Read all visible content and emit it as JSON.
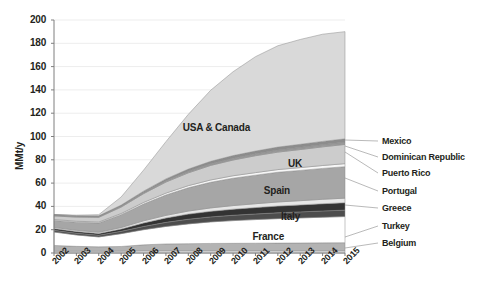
{
  "chart_data": {
    "type": "area",
    "title": "",
    "xlabel": "",
    "ylabel": "MMt/y",
    "ylim": [
      0,
      200
    ],
    "ytick_step": 20,
    "grid": true,
    "legend_position": "right-and-inline",
    "stacked": true,
    "x": [
      "2002",
      "2003",
      "2004",
      "2005",
      "2006",
      "2007",
      "2008",
      "2009",
      "2010",
      "2011",
      "2012",
      "2013",
      "2014",
      "2015"
    ],
    "yticks": [
      "0",
      "20",
      "40",
      "60",
      "80",
      "100",
      "120",
      "140",
      "160",
      "180",
      "200"
    ],
    "series": [
      {
        "name": "Belgium",
        "color": "#f2f2f2",
        "values": [
          1.5,
          1.5,
          1.5,
          1.6,
          1.8,
          1.8,
          1.8,
          1.8,
          1.8,
          1.8,
          1.8,
          1.8,
          1.8,
          1.8
        ]
      },
      {
        "name": "Turkey",
        "color": "#b3b3b3",
        "values": [
          5.0,
          4.2,
          3.8,
          4.0,
          5.2,
          6.0,
          6.2,
          6.4,
          6.5,
          6.6,
          6.7,
          6.8,
          6.9,
          7.0
        ]
      },
      {
        "name": "France",
        "color": "#ffffff",
        "values": [
          11.5,
          9.8,
          8.5,
          11.0,
          13.0,
          15.0,
          17.0,
          18.5,
          19.5,
          20.3,
          21.0,
          21.5,
          22.0,
          22.5
        ]
      },
      {
        "name": "Greece",
        "color": "#4d4d4d",
        "values": [
          1.5,
          1.5,
          1.5,
          2.0,
          2.8,
          3.5,
          4.0,
          4.3,
          4.6,
          4.8,
          5.0,
          5.2,
          5.4,
          5.5
        ]
      },
      {
        "name": "Italy",
        "color": "#333333",
        "values": [
          1.5,
          1.5,
          1.5,
          2.0,
          3.0,
          3.8,
          4.4,
          4.8,
          5.2,
          5.5,
          5.8,
          6.0,
          6.2,
          6.4
        ]
      },
      {
        "name": "Portugal",
        "color": "#e6e6e6",
        "values": [
          1.0,
          1.0,
          1.0,
          1.3,
          1.8,
          2.2,
          2.6,
          2.9,
          3.1,
          3.3,
          3.5,
          3.6,
          3.8,
          3.9
        ]
      },
      {
        "name": "Spain",
        "color": "#a6a6a6",
        "values": [
          6.0,
          7.0,
          8.0,
          11.0,
          14.5,
          17.5,
          20.0,
          22.0,
          23.5,
          24.5,
          25.5,
          26.0,
          26.5,
          27.0
        ]
      },
      {
        "name": "Puerto Rico",
        "color": "#f7f7f7",
        "values": [
          0.8,
          0.8,
          0.8,
          1.0,
          1.3,
          1.6,
          1.8,
          2.0,
          2.1,
          2.2,
          2.3,
          2.4,
          2.5,
          2.6
        ]
      },
      {
        "name": "UK",
        "color": "#cccccc",
        "values": [
          3.0,
          3.5,
          4.0,
          5.5,
          7.5,
          9.5,
          11.0,
          12.5,
          13.5,
          14.5,
          15.0,
          15.5,
          16.0,
          16.5
        ]
      },
      {
        "name": "Dominican Republic",
        "color": "#999999",
        "values": [
          0.6,
          0.6,
          0.6,
          0.8,
          1.0,
          1.2,
          1.4,
          1.5,
          1.6,
          1.7,
          1.8,
          1.9,
          2.0,
          2.0
        ]
      },
      {
        "name": "Mexico",
        "color": "#8c8c8c",
        "values": [
          0.6,
          0.6,
          0.7,
          0.9,
          1.2,
          1.5,
          1.8,
          2.0,
          2.2,
          2.3,
          2.5,
          2.6,
          2.7,
          2.8
        ]
      },
      {
        "name": "USA & Canada",
        "color": "#d9d9d9",
        "values": [
          0.0,
          0.5,
          1.0,
          7.0,
          18.0,
          32.0,
          47.0,
          61.0,
          72.0,
          81.0,
          87.0,
          90.0,
          92.0,
          92.0
        ]
      }
    ],
    "inline_labels": [
      {
        "text": "USA & Canada",
        "x": 250,
        "y": 122
      },
      {
        "text": "UK",
        "x": 302,
        "y": 158
      },
      {
        "text": "Spain",
        "x": 290,
        "y": 185
      },
      {
        "text": "Italy",
        "x": 300,
        "y": 211
      },
      {
        "text": "France",
        "x": 284,
        "y": 231
      }
    ],
    "legend_labels": [
      {
        "text": "Mexico",
        "x": 382,
        "y": 142
      },
      {
        "text": "Dominican Republic",
        "x": 382,
        "y": 158
      },
      {
        "text": "Puerto Rico",
        "x": 382,
        "y": 174
      },
      {
        "text": "Portugal",
        "x": 382,
        "y": 192
      },
      {
        "text": "Greece",
        "x": 382,
        "y": 209
      },
      {
        "text": "Turkey",
        "x": 382,
        "y": 227
      },
      {
        "text": "Belgium",
        "x": 382,
        "y": 244
      }
    ]
  }
}
